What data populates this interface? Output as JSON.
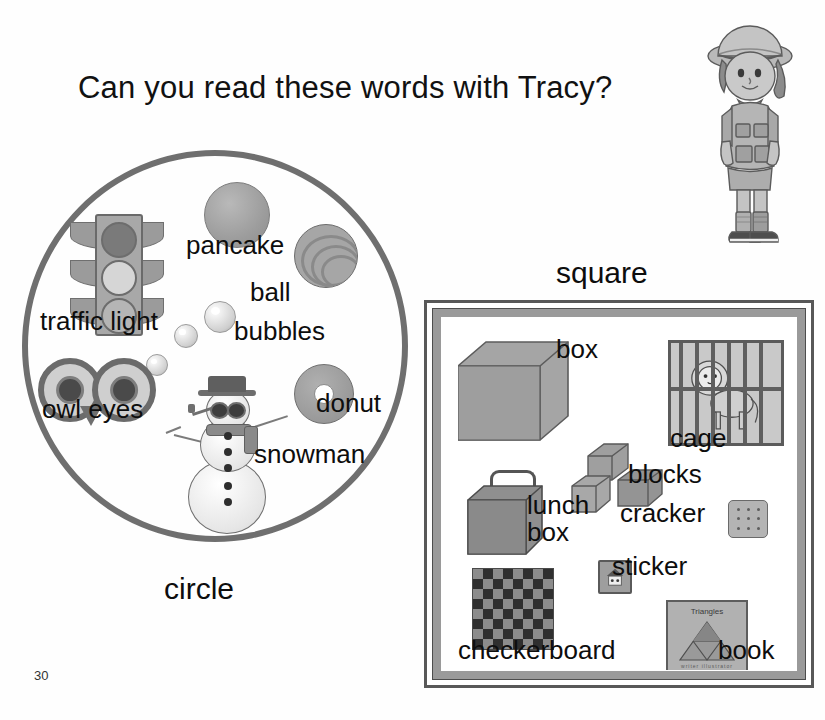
{
  "page": {
    "title": "Can you read these words with Tracy?",
    "page_number": "30",
    "character_name": "Tracy"
  },
  "circle_section": {
    "shape_label": "circle",
    "items": [
      {
        "label": "traffic light",
        "icon": "traffic-light-icon"
      },
      {
        "label": "pancake",
        "icon": "pancake-icon"
      },
      {
        "label": "ball",
        "icon": "ball-icon"
      },
      {
        "label": "bubbles",
        "icon": "bubbles-icon"
      },
      {
        "label": "owl eyes",
        "icon": "owl-eyes-icon"
      },
      {
        "label": "donut",
        "icon": "donut-icon"
      },
      {
        "label": "snowman",
        "icon": "snowman-icon"
      }
    ]
  },
  "square_section": {
    "shape_label": "square",
    "items": [
      {
        "label": "box",
        "icon": "box-icon"
      },
      {
        "label": "cage",
        "icon": "cage-icon"
      },
      {
        "label": "blocks",
        "icon": "blocks-icon"
      },
      {
        "label": "lunch\nbox",
        "icon": "lunch-box-icon"
      },
      {
        "label": "cracker",
        "icon": "cracker-icon"
      },
      {
        "label": "sticker",
        "icon": "sticker-icon"
      },
      {
        "label": "checkerboard",
        "icon": "checkerboard-icon"
      },
      {
        "label": "book",
        "icon": "book-icon"
      }
    ],
    "book_cover": {
      "title": "Triangles",
      "byline": "writer   illustrator"
    }
  },
  "colors": {
    "ink": "#0d0d0d",
    "paper": "#fefefe",
    "outline_gray": "#6f6f6f",
    "frame_gray": "#9a9a9a",
    "art_gray": "#a5a5a5"
  }
}
